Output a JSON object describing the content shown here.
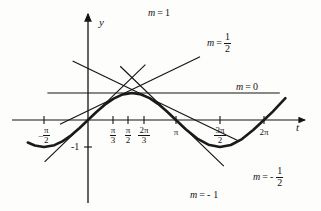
{
  "figure": {
    "title": "",
    "axes": {
      "x_label": "t",
      "y_label": "y"
    },
    "x_ticks": [
      {
        "name": "neg-pi-over-2",
        "sign": "–",
        "num": "π",
        "den": "2",
        "value": -1.5708,
        "px": 44
      },
      {
        "name": "pi-over-3",
        "sign": "",
        "num": "π",
        "den": "3",
        "value": 1.0472,
        "px": 113
      },
      {
        "name": "pi-over-2",
        "sign": "",
        "num": "π",
        "den": "2",
        "value": 1.5708,
        "px": 128
      },
      {
        "name": "two-pi-over-3",
        "sign": "",
        "num": "2π",
        "den": "3",
        "value": 2.0944,
        "px": 144
      },
      {
        "name": "pi",
        "sign": "",
        "num": "π",
        "den": "",
        "value": 3.1416,
        "px": 176
      },
      {
        "name": "three-pi-over-2",
        "sign": "",
        "num": "3π",
        "den": "2",
        "value": 4.7124,
        "px": 220
      },
      {
        "name": "two-pi",
        "sign": "",
        "num": "2π",
        "den": "",
        "value": 6.2832,
        "px": 264
      }
    ],
    "y_ticks": [
      {
        "name": "minus-one",
        "label": "-1",
        "value": -1,
        "px": 147
      }
    ],
    "slope_labels": [
      {
        "name": "m-equals-1",
        "m": "m",
        "eq": "=",
        "sign": "",
        "num": "1",
        "den": ""
      },
      {
        "name": "m-equals-one-half",
        "m": "m",
        "eq": "=",
        "sign": "",
        "num": "1",
        "den": "2"
      },
      {
        "name": "m-equals-0",
        "m": "m",
        "eq": "=",
        "sign": "",
        "num": "0",
        "den": ""
      },
      {
        "name": "m-equals-neg-one-half",
        "m": "m",
        "eq": "=",
        "sign": "-",
        "num": "1",
        "den": "2"
      },
      {
        "name": "m-equals-neg-1",
        "m": "m",
        "eq": "=",
        "sign": "-",
        "num": "1",
        "den": ""
      }
    ]
  },
  "chart_data": {
    "type": "line",
    "title": "",
    "xlabel": "t",
    "ylabel": "y",
    "xlim": [
      -2.15,
      7.05
    ],
    "ylim": [
      -2.2,
      2.35
    ],
    "grid": false,
    "legend": "inline-annotations",
    "curve": {
      "name": "sine-curve",
      "expression": "y = sin t",
      "color": "#1a1a1a",
      "width": 2.6,
      "x": [
        -2.15,
        -1.9,
        -1.5708,
        -1.2,
        -0.9,
        -0.6,
        -0.3,
        0,
        0.3,
        0.6,
        0.9,
        1.2,
        1.5708,
        1.9,
        2.2,
        2.5,
        2.8,
        3.1416,
        3.5,
        3.9,
        4.3,
        4.7124,
        5.1,
        5.5,
        5.9,
        6.2832,
        6.6,
        7.05
      ],
      "y": [
        -0.835,
        -0.946,
        -1,
        -0.932,
        -0.783,
        -0.565,
        -0.296,
        0,
        0.296,
        0.565,
        0.783,
        0.932,
        1,
        0.946,
        0.808,
        0.598,
        0.335,
        0,
        -0.351,
        -0.688,
        -0.916,
        -1,
        -0.926,
        -0.706,
        -0.373,
        0,
        0.311,
        0.811
      ]
    },
    "tangent_lines": [
      {
        "name": "tangent-m-1",
        "slope": 1,
        "label": "m = 1",
        "tangent_point": [
          0,
          0
        ],
        "x_from": -1.55,
        "x_to": 2.05
      },
      {
        "name": "tangent-m-half",
        "slope": 0.5,
        "label": "m = 1/2",
        "tangent_point": [
          1.0472,
          0.866
        ],
        "x_from": -1.0,
        "x_to": 4.0
      },
      {
        "name": "tangent-m-0",
        "slope": 0,
        "label": "m = 0",
        "tangent_point": [
          1.5708,
          1
        ],
        "x_from": -1.45,
        "x_to": 6.85
      },
      {
        "name": "tangent-m-neg-half",
        "slope": -0.5,
        "label": "m = -1/2",
        "tangent_point": [
          2.0944,
          0.866
        ],
        "x_from": -0.55,
        "x_to": 5.4
      },
      {
        "name": "tangent-m-neg-1",
        "slope": -1,
        "label": "m = -1",
        "tangent_point": [
          3.1416,
          0
        ],
        "x_from": 1.15,
        "x_to": 4.85
      }
    ]
  }
}
